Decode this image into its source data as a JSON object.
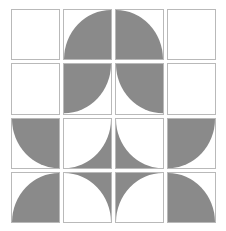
{
  "figure": {
    "type": "geometric-pattern",
    "rows": 4,
    "columns": 4,
    "background_color": "#ffffff",
    "fill_color": "#8a8a8a",
    "border_color": "#b9b9b9",
    "empty_color": "#ffffff"
  },
  "legend": {
    "shape_empty": "empty square",
    "shape_disc": "filled quarter circle",
    "shape_anti": "inverted quarter circle"
  },
  "tiles": [
    {
      "row": 1,
      "col": 1,
      "shape": "empty",
      "corner": "none",
      "name": "tile-r1c1"
    },
    {
      "row": 1,
      "col": 2,
      "shape": "disc",
      "corner": "bottom-right",
      "name": "tile-r1c2"
    },
    {
      "row": 1,
      "col": 3,
      "shape": "disc",
      "corner": "bottom-left",
      "name": "tile-r1c3"
    },
    {
      "row": 1,
      "col": 4,
      "shape": "empty",
      "corner": "none",
      "name": "tile-r1c4"
    },
    {
      "row": 2,
      "col": 1,
      "shape": "empty",
      "corner": "none",
      "name": "tile-r2c1"
    },
    {
      "row": 2,
      "col": 2,
      "shape": "disc",
      "corner": "top-left",
      "name": "tile-r2c2"
    },
    {
      "row": 2,
      "col": 3,
      "shape": "disc",
      "corner": "top-right",
      "name": "tile-r2c3"
    },
    {
      "row": 2,
      "col": 4,
      "shape": "empty",
      "corner": "none",
      "name": "tile-r2c4"
    },
    {
      "row": 3,
      "col": 1,
      "shape": "disc",
      "corner": "top-right",
      "name": "tile-r3c1"
    },
    {
      "row": 3,
      "col": 2,
      "shape": "anti",
      "corner": "bottom-right",
      "name": "tile-r3c2"
    },
    {
      "row": 3,
      "col": 3,
      "shape": "anti",
      "corner": "bottom-left",
      "name": "tile-r3c3"
    },
    {
      "row": 3,
      "col": 4,
      "shape": "disc",
      "corner": "top-left",
      "name": "tile-r3c4"
    },
    {
      "row": 4,
      "col": 1,
      "shape": "disc",
      "corner": "bottom-right",
      "name": "tile-r4c1"
    },
    {
      "row": 4,
      "col": 2,
      "shape": "anti",
      "corner": "top-right",
      "name": "tile-r4c2"
    },
    {
      "row": 4,
      "col": 3,
      "shape": "anti",
      "corner": "top-left",
      "name": "tile-r4c3"
    },
    {
      "row": 4,
      "col": 4,
      "shape": "disc",
      "corner": "bottom-left",
      "name": "tile-r4c4"
    }
  ]
}
